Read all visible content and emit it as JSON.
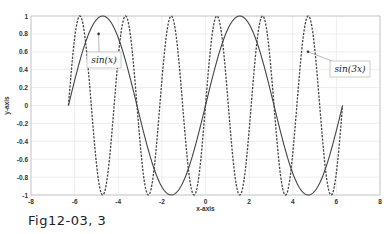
{
  "chart_data": {
    "type": "line",
    "title": "",
    "xlabel": "x-axis",
    "ylabel": "y-axis",
    "xlim": [
      -8,
      8
    ],
    "ylim": [
      -1,
      1
    ],
    "x_ticks": [
      "-8",
      "-6",
      "-4",
      "-2",
      "0",
      "2",
      "4",
      "6",
      "8"
    ],
    "y_ticks": [
      "-1",
      "-0.8",
      "-0.6",
      "-0.4",
      "-0.2",
      "0",
      "0.2",
      "0.4",
      "0.6",
      "0.8",
      "1"
    ],
    "grid": true,
    "x_range": [
      -6.283,
      6.283
    ],
    "series": [
      {
        "name": "sin(x)",
        "function": "sin(x)",
        "style": "solid",
        "color": "#444444"
      },
      {
        "name": "sin(3x)",
        "function": "sin(3x)",
        "style": "dashed",
        "color": "#444444"
      }
    ],
    "annotations": [
      {
        "text": "sin(x)",
        "arrow_to_x": -4.9,
        "arrow_to_y": 0.8
      },
      {
        "text": "sin(3x)",
        "arrow_to_x": 4.7,
        "arrow_to_y": 0.6
      }
    ]
  },
  "caption": "Fig12-03, 3"
}
